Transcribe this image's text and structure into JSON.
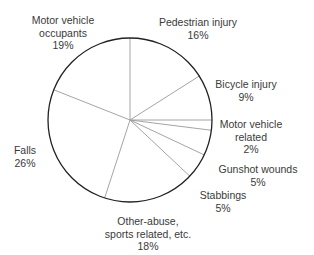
{
  "chart_data": {
    "type": "pie",
    "title": "",
    "start_angle_deg": 0,
    "direction": "clockwise",
    "categories": [
      "Pedestrian injury",
      "Bicycle injury",
      "Motor vehicle related",
      "Gunshot wounds",
      "Stabbings",
      "Other-abuse, sports related, etc.",
      "Falls",
      "Motor vehicle occupants"
    ],
    "values": [
      16,
      9,
      2,
      5,
      5,
      18,
      26,
      19
    ],
    "unit": "%",
    "legend": "none (direct labels)",
    "colors": {
      "fill": "#ffffff",
      "outline": "#222222",
      "spokes": "#9a9a9a",
      "text": "#3a3a3a"
    }
  },
  "labels": [
    {
      "name": "pedestrian-injury",
      "lines": [
        "Pedestrian injury",
        "16%"
      ],
      "x": 198,
      "y": 16
    },
    {
      "name": "bicycle-injury",
      "lines": [
        "Bicycle injury",
        "9%"
      ],
      "x": 246,
      "y": 78
    },
    {
      "name": "motor-vehicle-related",
      "lines": [
        "Motor vehicle",
        "related",
        "2%"
      ],
      "x": 251,
      "y": 118
    },
    {
      "name": "gunshot-wounds",
      "lines": [
        "Gunshot wounds",
        "5%"
      ],
      "x": 258,
      "y": 163
    },
    {
      "name": "stabbings",
      "lines": [
        "Stabbings",
        "5%"
      ],
      "x": 223,
      "y": 189
    },
    {
      "name": "other-abuse",
      "lines": [
        "Other-abuse,",
        "sports related, etc.",
        "18%"
      ],
      "x": 148,
      "y": 215
    },
    {
      "name": "falls",
      "lines": [
        "Falls",
        "26%"
      ],
      "x": 25,
      "y": 144
    },
    {
      "name": "motor-vehicle-occupants",
      "lines": [
        "Motor vehicle",
        "occupants",
        "19%"
      ],
      "x": 63,
      "y": 14
    }
  ],
  "geometry": {
    "cx": 130,
    "cy": 120,
    "r": 82
  }
}
